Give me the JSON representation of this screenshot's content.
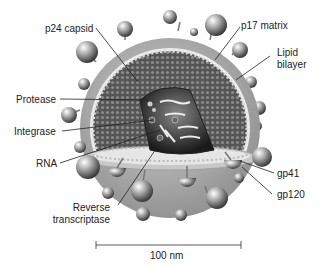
{
  "diagram": {
    "labels": {
      "p24_capsid": "p24 capsid",
      "p17_matrix": "p17 matrix",
      "lipid_line1": "Lipid",
      "lipid_line2": "bilayer",
      "protease": "Protease",
      "integrase": "Integrase",
      "rna": "RNA",
      "rt_line1": "Reverse",
      "rt_line2": "transcriptase",
      "gp41": "gp41",
      "gp120": "gp120"
    },
    "scale_bar": {
      "label": "100 nm"
    }
  }
}
